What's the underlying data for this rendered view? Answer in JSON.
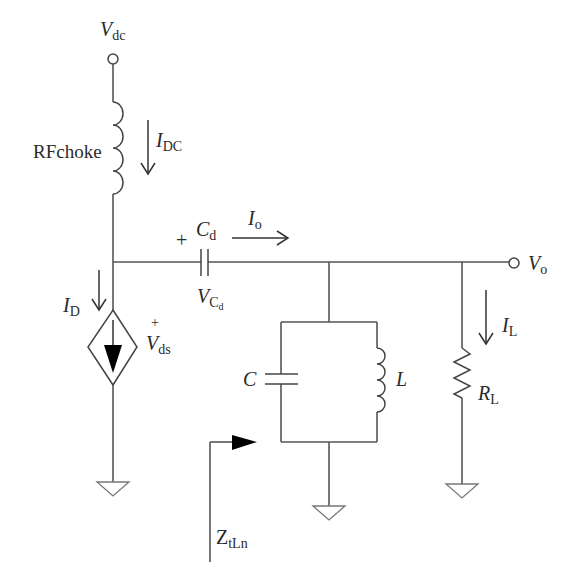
{
  "diagram": {
    "colors": {
      "wire": "#555555",
      "text": "#2a2a2a",
      "background": "#ffffff",
      "fill": "#000000"
    },
    "labels": {
      "vdc": {
        "main": "V",
        "sub": "dc"
      },
      "rfchoke": "RFchoke",
      "idc": {
        "main": "I",
        "sub": "DC"
      },
      "cd": {
        "main": "C",
        "sub": "d"
      },
      "cd_plus": "+",
      "io": {
        "main": "I",
        "sub": "o"
      },
      "vcd": {
        "main": "V",
        "sub": "C",
        "subsub": "d"
      },
      "id": {
        "main": "I",
        "sub": "D"
      },
      "vds_plus": "+",
      "vds": {
        "main": "V",
        "sub": "ds"
      },
      "c": "C",
      "l": "L",
      "vo": {
        "main": "V",
        "sub": "o"
      },
      "il": {
        "main": "I",
        "sub": "L"
      },
      "rl": {
        "main": "R",
        "sub": "L"
      },
      "ztln": {
        "main": "Z",
        "sub": "tLn"
      }
    },
    "components": [
      {
        "id": "vdc-terminal",
        "type": "terminal"
      },
      {
        "id": "rf-choke",
        "type": "inductor"
      },
      {
        "id": "dependent-current-source",
        "type": "diamond-current-source"
      },
      {
        "id": "cd",
        "type": "capacitor"
      },
      {
        "id": "tank-c",
        "type": "capacitor"
      },
      {
        "id": "tank-l",
        "type": "inductor"
      },
      {
        "id": "rl",
        "type": "resistor"
      },
      {
        "id": "vo-terminal",
        "type": "terminal"
      },
      {
        "id": "ground-1",
        "type": "ground"
      },
      {
        "id": "ground-2",
        "type": "ground"
      },
      {
        "id": "ground-3",
        "type": "ground"
      }
    ]
  }
}
